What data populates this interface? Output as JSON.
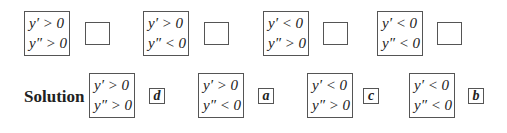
{
  "question_row": [
    {
      "line1": "y′ > 0",
      "line2": "y″ > 0",
      "answer": ""
    },
    {
      "line1": "y′ > 0",
      "line2": "y″ < 0",
      "answer": ""
    },
    {
      "line1": "y′ < 0",
      "line2": "y″ > 0",
      "answer": ""
    },
    {
      "line1": "y′ < 0",
      "line2": "y″ < 0",
      "answer": ""
    }
  ],
  "solution": {
    "label": "Solution",
    "items": [
      {
        "line1": "y′ > 0",
        "line2": "y″ > 0",
        "answer": "d"
      },
      {
        "line1": "y′ > 0",
        "line2": "y″ < 0",
        "answer": "a"
      },
      {
        "line1": "y′ < 0",
        "line2": "y″ > 0",
        "answer": "c"
      },
      {
        "line1": "y′ < 0",
        "line2": "y″ < 0",
        "answer": "b"
      }
    ]
  }
}
